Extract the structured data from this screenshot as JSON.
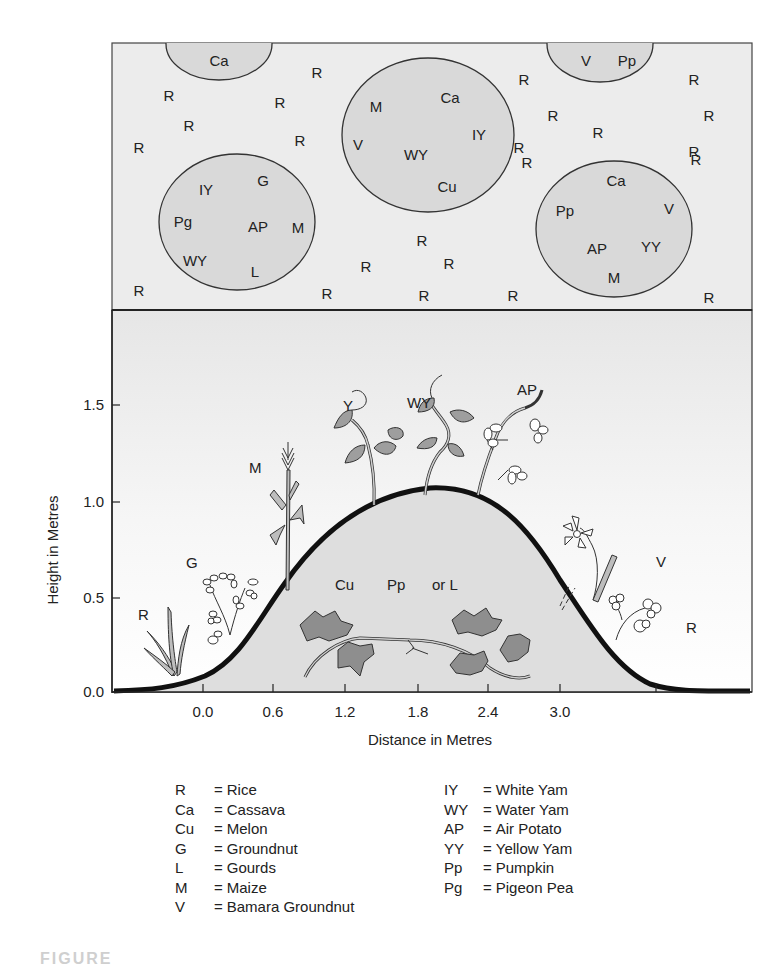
{
  "plan_view": {
    "background": "#ececec",
    "circle_fill": "#d9d9d9",
    "circles": [
      {
        "cx": 219,
        "cy": 44,
        "rx": 53,
        "ry": 36,
        "labels": [
          {
            "t": "Ca",
            "x": 219,
            "y": 66
          }
        ]
      },
      {
        "cx": 428,
        "cy": 135,
        "rx": 86,
        "ry": 77,
        "labels": [
          {
            "t": "M",
            "x": 376,
            "y": 112
          },
          {
            "t": "Ca",
            "x": 450,
            "y": 103
          },
          {
            "t": "IY",
            "x": 479,
            "y": 140
          },
          {
            "t": "V",
            "x": 358,
            "y": 150
          },
          {
            "t": "WY",
            "x": 416,
            "y": 160
          },
          {
            "t": "Cu",
            "x": 447,
            "y": 192
          }
        ]
      },
      {
        "cx": 600,
        "cy": 44,
        "rx": 53,
        "ry": 38,
        "labels": [
          {
            "t": "V",
            "x": 586,
            "y": 66
          },
          {
            "t": "Pp",
            "x": 627,
            "y": 66
          }
        ]
      },
      {
        "cx": 237,
        "cy": 222,
        "rx": 78,
        "ry": 68,
        "labels": [
          {
            "t": "IY",
            "x": 206,
            "y": 195
          },
          {
            "t": "G",
            "x": 263,
            "y": 186
          },
          {
            "t": "Pg",
            "x": 183,
            "y": 227
          },
          {
            "t": "AP",
            "x": 258,
            "y": 232
          },
          {
            "t": "M",
            "x": 298,
            "y": 233
          },
          {
            "t": "WY",
            "x": 195,
            "y": 266
          },
          {
            "t": "L",
            "x": 255,
            "y": 277
          }
        ]
      },
      {
        "cx": 614,
        "cy": 229,
        "rx": 78,
        "ry": 68,
        "labels": [
          {
            "t": "Ca",
            "x": 616,
            "y": 186
          },
          {
            "t": "Pp",
            "x": 565,
            "y": 216
          },
          {
            "t": "V",
            "x": 669,
            "y": 214
          },
          {
            "t": "AP",
            "x": 597,
            "y": 254
          },
          {
            "t": "YY",
            "x": 651,
            "y": 252
          },
          {
            "t": "M",
            "x": 614,
            "y": 283
          }
        ]
      }
    ],
    "rice_labels": [
      {
        "x": 317,
        "y": 78
      },
      {
        "x": 169,
        "y": 101
      },
      {
        "x": 280,
        "y": 108
      },
      {
        "x": 189,
        "y": 131
      },
      {
        "x": 139,
        "y": 153
      },
      {
        "x": 300,
        "y": 146
      },
      {
        "x": 524,
        "y": 85
      },
      {
        "x": 694,
        "y": 85
      },
      {
        "x": 553,
        "y": 121
      },
      {
        "x": 709,
        "y": 121
      },
      {
        "x": 598,
        "y": 138
      },
      {
        "x": 519,
        "y": 153
      },
      {
        "x": 694,
        "y": 157
      },
      {
        "x": 527,
        "y": 168
      },
      {
        "x": 696,
        "y": 165
      },
      {
        "x": 422,
        "y": 246
      },
      {
        "x": 449,
        "y": 269
      },
      {
        "x": 366,
        "y": 272
      },
      {
        "x": 139,
        "y": 296
      },
      {
        "x": 327,
        "y": 299
      },
      {
        "x": 424,
        "y": 301
      },
      {
        "x": 513,
        "y": 301
      },
      {
        "x": 709,
        "y": 303
      }
    ],
    "rice_code": "R"
  },
  "chart_data": {
    "type": "area",
    "title": "",
    "xlabel": "Distance in Metres",
    "ylabel": "Height in Metres",
    "x_ticks": [
      "0.0",
      "0.6",
      "1.2",
      "1.8",
      "2.4",
      "3.0"
    ],
    "y_ticks": [
      "0.0",
      "0.5",
      "1.0",
      "1.5"
    ],
    "ylim": [
      0,
      1.95
    ],
    "grid": false,
    "series": [
      {
        "name": "Mound profile",
        "x": [
          -0.8,
          -0.4,
          0.0,
          0.3,
          0.6,
          0.9,
          1.2,
          1.5,
          1.8,
          2.1,
          2.4,
          2.7,
          3.0,
          3.3,
          3.6
        ],
        "values": [
          0.0,
          0.04,
          0.18,
          0.45,
          0.72,
          0.92,
          1.03,
          1.07,
          1.05,
          0.95,
          0.78,
          0.5,
          0.2,
          0.03,
          0.0
        ]
      }
    ],
    "annotations": [
      {
        "label": "R",
        "x": -0.45,
        "y": 0.32
      },
      {
        "label": "G",
        "x": -0.05,
        "y": 0.62
      },
      {
        "label": "M",
        "x": 0.5,
        "y": 1.18
      },
      {
        "label": "Y",
        "x": 1.0,
        "y": 1.6
      },
      {
        "label": "WY",
        "x": 1.6,
        "y": 1.62
      },
      {
        "label": "AP",
        "x": 2.15,
        "y": 1.45
      },
      {
        "label": "Cu",
        "x": 1.15,
        "y": 0.5
      },
      {
        "label": "Pp",
        "x": 1.6,
        "y": 0.5
      },
      {
        "label": "or L",
        "x": 2.0,
        "y": 0.5
      },
      {
        "label": "V",
        "x": 3.25,
        "y": 0.62
      },
      {
        "label": "R",
        "x": 3.45,
        "y": 0.33
      }
    ]
  },
  "section": {
    "labels": {
      "R_left": "R",
      "G": "G",
      "M": "M",
      "Y": "Y",
      "WY": "WY",
      "AP": "AP",
      "Cu": "Cu",
      "Pp": "Pp",
      "orL": "or L",
      "V": "V",
      "R_right": "R"
    }
  },
  "legend": {
    "left": [
      {
        "code": "R",
        "name": "Rice"
      },
      {
        "code": "Ca",
        "name": "Cassava"
      },
      {
        "code": "Cu",
        "name": "Melon"
      },
      {
        "code": "G",
        "name": "Groundnut"
      },
      {
        "code": "L",
        "name": "Gourds"
      },
      {
        "code": "M",
        "name": "Maize"
      },
      {
        "code": "V",
        "name": "Bamara Groundnut"
      }
    ],
    "right": [
      {
        "code": "IY",
        "name": "White Yam"
      },
      {
        "code": "WY",
        "name": "Water Yam"
      },
      {
        "code": "AP",
        "name": "Air Potato"
      },
      {
        "code": "YY",
        "name": "Yellow Yam"
      },
      {
        "code": "Pp",
        "name": "Pumpkin"
      },
      {
        "code": "Pg",
        "name": "Pigeon Pea"
      }
    ],
    "equals": "="
  },
  "caption": {
    "text": "FIGURE"
  }
}
